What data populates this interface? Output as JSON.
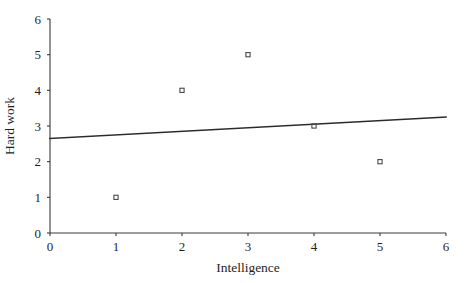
{
  "chart_data": {
    "type": "scatter",
    "title": "",
    "xlabel": "Intelligence",
    "ylabel": "Hard work",
    "xlim": [
      0,
      6
    ],
    "ylim": [
      0,
      6
    ],
    "xticks": [
      "0",
      "1",
      "2",
      "3",
      "4",
      "5",
      "6"
    ],
    "yticks": [
      "0",
      "1",
      "2",
      "3",
      "4",
      "5",
      "6"
    ],
    "grid": false,
    "legend": "none",
    "points": [
      {
        "x": 1,
        "y": 1
      },
      {
        "x": 2,
        "y": 4
      },
      {
        "x": 3,
        "y": 5
      },
      {
        "x": 4,
        "y": 3
      },
      {
        "x": 5,
        "y": 2
      }
    ],
    "marker_style": "open-square",
    "trend_line": {
      "label": "",
      "x_start": 0,
      "y_start": 2.65,
      "x_end": 6,
      "y_end": 3.25,
      "slope": 0.1,
      "intercept": 2.65
    },
    "colors": {
      "axis": "#3a3a3a",
      "marker": "#4a4a4a",
      "trend": "#2b2b2b",
      "text": "#1f1f1f",
      "background": "#ffffff"
    }
  }
}
